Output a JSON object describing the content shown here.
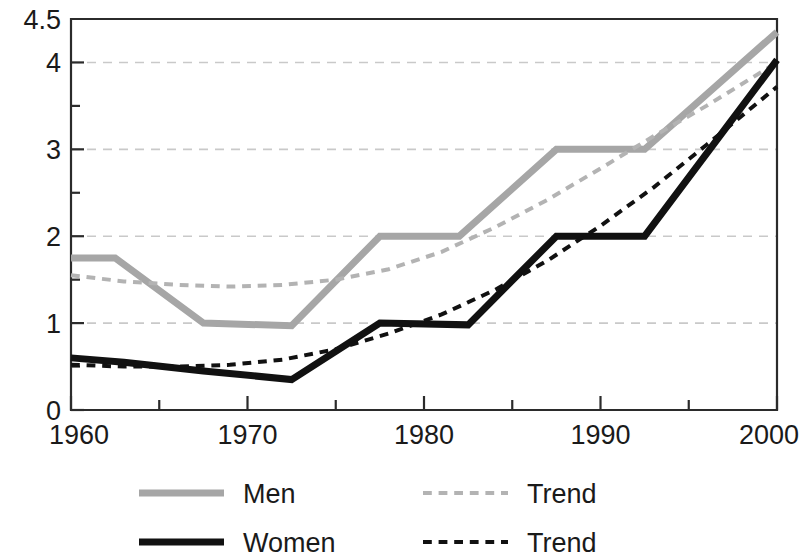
{
  "chart_data": {
    "type": "line",
    "title": "",
    "subtitle": "",
    "xlabel": "",
    "ylabel": "",
    "xlim": [
      1960,
      2000
    ],
    "ylim": [
      0,
      4.5
    ],
    "x_ticks": [
      1960,
      1970,
      1980,
      1990,
      2000
    ],
    "x_tick_labels": [
      "1960",
      "1970",
      "1980",
      "1990",
      "2000"
    ],
    "x_minor_ticks": [
      1965,
      1975,
      1985,
      1995
    ],
    "y_ticks": [
      0,
      1,
      2,
      3,
      4,
      4.5
    ],
    "y_tick_labels": [
      "0",
      "1",
      "2",
      "3",
      "4",
      "4.5"
    ],
    "y_minor_ticks": [
      0.5,
      1.5,
      2.5,
      3.5
    ],
    "gridlines": {
      "horizontal": [
        1,
        2,
        3,
        4
      ],
      "vertical": []
    },
    "legend_position": "bottom",
    "series": [
      {
        "name": "Men",
        "style": "solid",
        "color": "#a6a6a6",
        "width": 7,
        "x": [
          1960,
          1962.5,
          1967.5,
          1972.5,
          1977.5,
          1982,
          1987.5,
          1992.5,
          2000
        ],
        "values": [
          1.75,
          1.75,
          1.0,
          0.97,
          2.0,
          2.0,
          3.0,
          3.0,
          4.35
        ]
      },
      {
        "name": "Trend",
        "style": "dashed",
        "color": "#b3b3b3",
        "width": 4,
        "x": [
          1960,
          1963,
          1966,
          1969,
          1972,
          1975,
          1978,
          1981,
          1984,
          1987,
          1990,
          1993,
          1996,
          2000
        ],
        "values": [
          1.55,
          1.48,
          1.44,
          1.42,
          1.44,
          1.5,
          1.62,
          1.82,
          2.1,
          2.42,
          2.78,
          3.15,
          3.5,
          4.0
        ]
      },
      {
        "name": "Women",
        "style": "solid",
        "color": "#111111",
        "width": 7,
        "x": [
          1960,
          1963,
          1967.5,
          1972.5,
          1977.5,
          1982.5,
          1987.5,
          1992.5,
          2000
        ],
        "values": [
          0.6,
          0.55,
          0.45,
          0.35,
          1.0,
          0.98,
          2.0,
          2.0,
          4.03
        ]
      },
      {
        "name": "Trend",
        "style": "dashed",
        "color": "#111111",
        "width": 4,
        "x": [
          1960,
          1963,
          1966,
          1969,
          1972,
          1975,
          1978,
          1981,
          1984,
          1987,
          1990,
          1993,
          1996,
          2000
        ],
        "values": [
          0.52,
          0.5,
          0.5,
          0.52,
          0.58,
          0.7,
          0.88,
          1.1,
          1.38,
          1.72,
          2.12,
          2.56,
          3.05,
          3.72
        ]
      }
    ]
  },
  "legend": {
    "entries": [
      {
        "label": "Men",
        "style": "solid",
        "color": "#a6a6a6"
      },
      {
        "label": "Trend",
        "style": "dashed",
        "color": "#b3b3b3"
      },
      {
        "label": "Women",
        "style": "solid",
        "color": "#111111"
      },
      {
        "label": "Trend",
        "style": "dashed",
        "color": "#111111"
      }
    ]
  },
  "colors": {
    "men": "#a6a6a6",
    "men_trend": "#b3b3b3",
    "women": "#111111",
    "women_trend": "#111111",
    "axis": "#2b2b2b",
    "grid": "#c9c9c9",
    "background": "#ffffff"
  }
}
